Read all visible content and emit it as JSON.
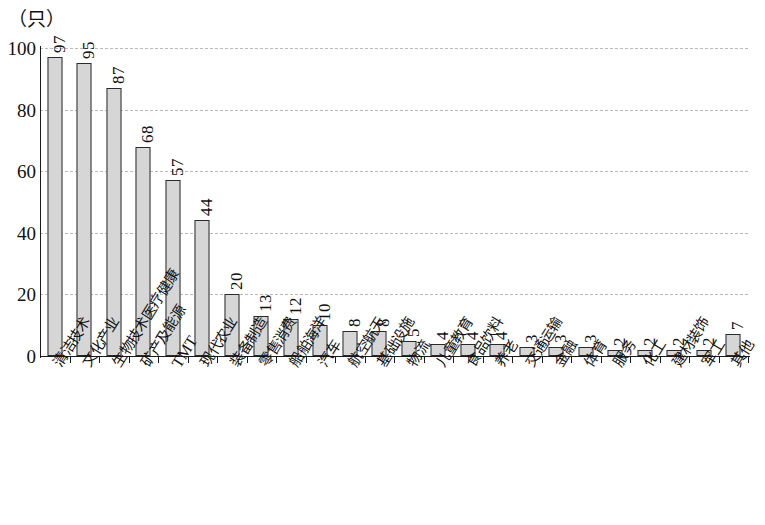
{
  "chart_data": {
    "type": "bar",
    "title": "",
    "unit_label": "（只）",
    "xlabel": "",
    "ylabel": "",
    "ylim": [
      0,
      100
    ],
    "yticks": [
      0,
      20,
      40,
      60,
      80,
      100
    ],
    "grid": true,
    "legend": "none",
    "categories": [
      "清洁技术",
      "文化产业",
      "生物技术医疗健康",
      "矿产及能源",
      "TMT",
      "现代农业",
      "装备制造",
      "零售消费",
      "船舶海洋",
      "汽车",
      "航空航天",
      "基础设施",
      "物流",
      "儿童教育",
      "食品饮料",
      "养老",
      "交通运输",
      "金融",
      "体育",
      "服务",
      "化工",
      "建材装饰",
      "军工",
      "其他"
    ],
    "values": [
      97,
      95,
      87,
      68,
      57,
      44,
      20,
      13,
      12,
      10,
      8,
      8,
      5,
      4,
      4,
      4,
      3,
      3,
      3,
      2,
      2,
      2,
      2,
      7
    ],
    "value_labels": [
      "97",
      "95",
      "87",
      "68",
      "57",
      "44",
      "20",
      "13",
      "12",
      "10",
      "8",
      "8",
      "5",
      "4",
      "4",
      "4",
      "3",
      "3",
      "3",
      "2",
      "2",
      "2",
      "2",
      "7"
    ],
    "bar_color": "#d6d6d6",
    "bar_edge_color": "#2a2a2a",
    "gridline_color": "#b9b9b9",
    "axis_color": "#1a1a1a"
  }
}
